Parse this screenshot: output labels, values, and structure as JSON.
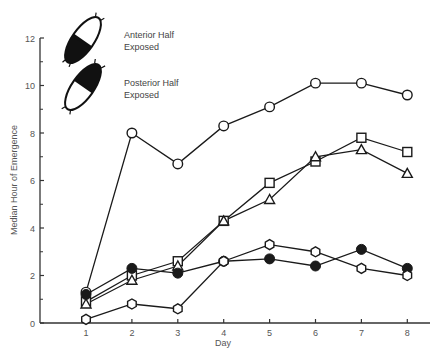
{
  "chart_data": {
    "type": "line",
    "title": "",
    "xlabel": "Day",
    "ylabel": "Median Hour of Emergence",
    "x": [
      1,
      2,
      3,
      4,
      5,
      6,
      7,
      8
    ],
    "xlim": [
      0.1,
      8.5
    ],
    "ylim": [
      0,
      12
    ],
    "yticks_major": [
      0,
      2,
      4,
      6,
      8,
      10,
      12
    ],
    "yticks_minor": [
      1,
      3,
      5,
      7,
      9,
      11
    ],
    "grid": false,
    "legend_position": "upper-left",
    "legend": [
      {
        "label_line1": "Anterior Half",
        "label_line2": "Exposed",
        "icon": "pupa-anterior-black-icon"
      },
      {
        "label_line1": "Posterior Half",
        "label_line2": "Exposed",
        "icon": "pupa-posterior-black-icon"
      }
    ],
    "series": [
      {
        "name": "open-circle",
        "marker": "open-circle",
        "values": [
          1.3,
          8.0,
          6.7,
          8.3,
          9.1,
          10.1,
          10.1,
          9.6
        ]
      },
      {
        "name": "open-square",
        "marker": "open-square",
        "values": [
          0.9,
          2.0,
          2.6,
          4.3,
          5.9,
          6.8,
          7.8,
          7.2
        ]
      },
      {
        "name": "open-triangle",
        "marker": "open-triangle",
        "values": [
          0.8,
          1.8,
          2.4,
          4.3,
          5.2,
          7.0,
          7.3,
          6.3
        ]
      },
      {
        "name": "filled-circle",
        "marker": "filled-circle",
        "values": [
          1.2,
          2.3,
          2.1,
          2.6,
          2.7,
          2.4,
          3.1,
          2.3
        ]
      },
      {
        "name": "open-hexagon",
        "marker": "open-hexagon",
        "values": [
          0.15,
          0.8,
          0.6,
          2.6,
          3.3,
          3.0,
          2.3,
          2.0
        ]
      }
    ]
  },
  "axes": {
    "x_tick_labels": [
      "1",
      "2",
      "3",
      "4",
      "5",
      "6",
      "7",
      "8"
    ],
    "y_tick_labels": [
      "0",
      "2",
      "4",
      "6",
      "8",
      "10",
      "12"
    ],
    "x_title": "Day",
    "y_title": "Median Hour of Emergence"
  },
  "colors": {
    "ink": "#1a1a1a",
    "axis": "#333333",
    "text": "#555555"
  }
}
